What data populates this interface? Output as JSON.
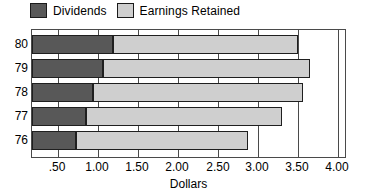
{
  "chart_data": {
    "type": "bar",
    "orientation": "horizontal",
    "stacked": true,
    "title": "",
    "xlabel": "Dollars",
    "ylabel": "",
    "xlim": [
      0.0,
      4.0
    ],
    "xticks": [
      0.5,
      1.0,
      1.5,
      2.0,
      2.5,
      3.0,
      3.5,
      4.0
    ],
    "xtick_labels": [
      ".50",
      "1.00",
      "1.50",
      "2.00",
      "2.50",
      "3.00",
      "3.50",
      "4.00"
    ],
    "categories": [
      "80",
      "79",
      "78",
      "77",
      "76"
    ],
    "grid": true,
    "legend_position": "top-left",
    "series": [
      {
        "name": "Dividends",
        "color": "#585858",
        "values": [
          1.19,
          1.06,
          0.94,
          0.85,
          0.73
        ]
      },
      {
        "name": "Earnings Retained",
        "color": "#cfcfcf",
        "values": [
          2.31,
          2.59,
          2.62,
          2.45,
          2.15
        ]
      }
    ],
    "totals": [
      3.5,
      3.65,
      3.56,
      3.3,
      2.88
    ]
  },
  "legend": {
    "entries": [
      {
        "label": "Dividends",
        "swatch": "dark-swatch-icon"
      },
      {
        "label": "Earnings Retained",
        "swatch": "light-swatch-icon"
      }
    ]
  },
  "axis": {
    "x_title": "Dollars"
  }
}
